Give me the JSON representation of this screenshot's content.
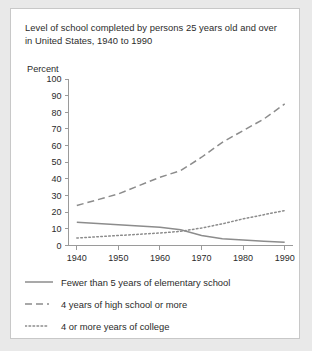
{
  "chart_data": {
    "type": "line",
    "title": "Level of school completed by persons 25 years old and over in United States, 1940 to 1990",
    "xlabel": "",
    "ylabel": "Percent",
    "xlim": [
      1938,
      1992
    ],
    "ylim": [
      0,
      100
    ],
    "grid": false,
    "legend_position": "below",
    "x_ticks": [
      "1940",
      "1950",
      "1960",
      "1970",
      "1980",
      "1990"
    ],
    "y_ticks": [
      "0",
      "10",
      "20",
      "30",
      "40",
      "50",
      "60",
      "70",
      "80",
      "90",
      "100"
    ],
    "x": [
      1940,
      1950,
      1960,
      1965,
      1970,
      1975,
      1980,
      1985,
      1990
    ],
    "series": [
      {
        "name": "Fewer than 5 years of elementary school",
        "style": "solid",
        "color": "#8c8c8c",
        "values": [
          14,
          12.5,
          11,
          9.5,
          6,
          4,
          3.3,
          2.6,
          2
        ]
      },
      {
        "name": "4 years of high school or more",
        "style": "dashed",
        "color": "#8c8c8c",
        "values": [
          24,
          31,
          41,
          45,
          53,
          62,
          69,
          76,
          85
        ]
      },
      {
        "name": "4 or more years of college",
        "style": "dotted",
        "color": "#8c8c8c",
        "values": [
          4.5,
          6,
          7.5,
          8.5,
          10.5,
          13,
          16,
          18.5,
          21
        ]
      }
    ]
  },
  "legend": {
    "items": [
      {
        "label": "Fewer than 5 years of elementary school",
        "style": "solid"
      },
      {
        "label": "4 years of high school or more",
        "style": "dashed"
      },
      {
        "label": "4 or more years of college",
        "style": "dotted"
      }
    ]
  }
}
